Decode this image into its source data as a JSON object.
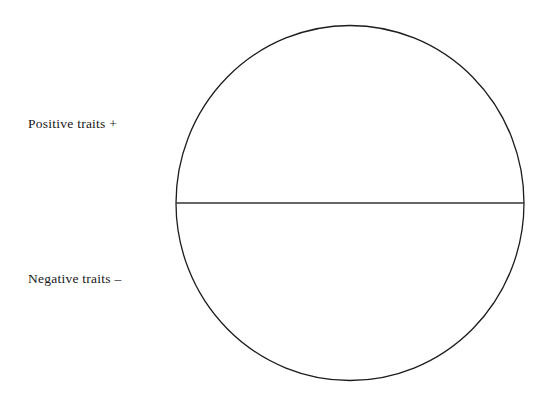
{
  "figure": {
    "kind": "bisected-circle-diagram",
    "background_color": "#ffffff",
    "stroke_color": "#1c1c1c",
    "text_color": "#17171a",
    "width": 549,
    "height": 399
  },
  "circle": {
    "name": "whole-circle",
    "center_x": 350,
    "center_y": 203,
    "radius_x": 174,
    "radius_y": 177.5,
    "stroke_width": 1.3,
    "fill": "none"
  },
  "divider": {
    "name": "horizontal-diameter",
    "x1": 176,
    "y1": 203,
    "x2": 524,
    "y2": 203,
    "stroke_width": 1.6
  },
  "labels": {
    "positive": {
      "text": "Positive traits +",
      "sign": "+",
      "half": "upper"
    },
    "negative": {
      "text": "Negative traits –",
      "sign": "–",
      "half": "lower"
    }
  }
}
